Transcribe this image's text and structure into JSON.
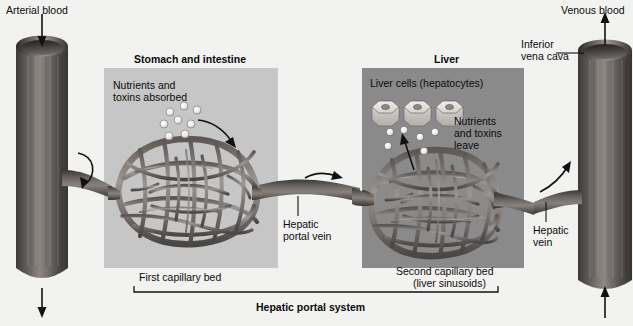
{
  "figure": {
    "title": "Hepatic portal system",
    "background_color": "#f2f2f0",
    "panel_stomach_color": "#c6c6c6",
    "panel_liver_color": "#8a8a8a",
    "vessel_color": "#54504e"
  },
  "labels": {
    "arterial_blood": "Arterial blood",
    "venous_blood": "Venous blood",
    "inferior_vena_cava_line1": "Inferior",
    "inferior_vena_cava_line2": "vena cava",
    "stomach_and_intestine": "Stomach and intestine",
    "liver": "Liver",
    "nutrients_absorbed_line1": "Nutrients and",
    "nutrients_absorbed_line2": "toxins absorbed",
    "liver_cells": "Liver cells (hepatocytes)",
    "nutrients_leave_line1": "Nutrients",
    "nutrients_leave_line2": "and toxins",
    "nutrients_leave_line3": "leave",
    "hepatic_portal_vein_line1": "Hepatic",
    "hepatic_portal_vein_line2": "portal vein",
    "hepatic_vein_line1": "Hepatic",
    "hepatic_vein_line2": "vein",
    "first_capillary_bed": "First capillary bed",
    "second_capillary_bed_line1": "Second capillary bed",
    "second_capillary_bed_line2": "(liver sinusoids)",
    "hepatic_portal_system": "Hepatic portal system"
  },
  "structures": {
    "left_vessel_name": "aorta-arterial-vessel",
    "right_vessel_name": "inferior-vena-cava-vessel",
    "hepatocyte_count": 3,
    "absorbed_particle_count": 8,
    "leaving_particle_count": 6
  }
}
